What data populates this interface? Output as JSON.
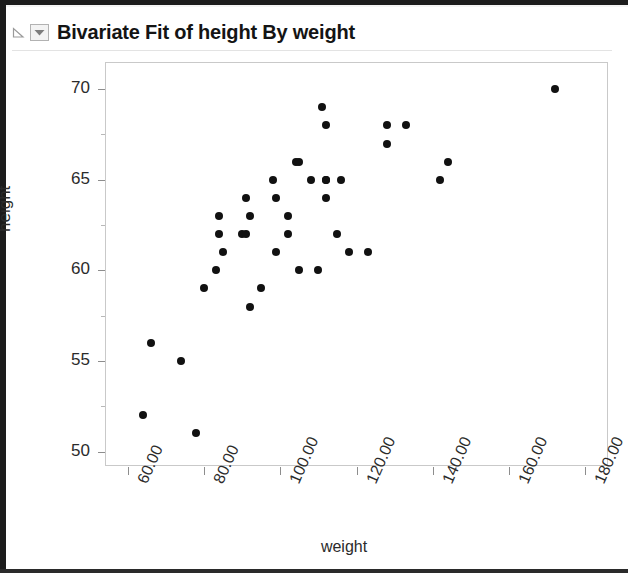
{
  "window": {
    "border_color": "#1c1c1c",
    "background": "#ffffff"
  },
  "header": {
    "title": "Bivariate Fit of height By weight",
    "disclosure_icon": "triangle-outline-icon",
    "menu_icon": "chevron-down-icon"
  },
  "chart_data": {
    "type": "scatter",
    "title": "Bivariate Fit of height By weight",
    "xlabel": "weight",
    "ylabel": "height",
    "xlim": [
      54,
      186
    ],
    "ylim": [
      49.2,
      71.5
    ],
    "xticks": [
      60,
      80,
      100,
      120,
      140,
      160,
      180
    ],
    "xtick_labels": [
      "60.00",
      "80.00",
      "100.00",
      "120.00",
      "140.00",
      "160.00",
      "180.00"
    ],
    "yticks": [
      50,
      55,
      60,
      65,
      70
    ],
    "ytick_labels": [
      "50",
      "55",
      "60",
      "65",
      "70"
    ],
    "y_minor_ticks": [
      52.5,
      57.5,
      62.5,
      67.5
    ],
    "grid": false,
    "legend": null,
    "marker": {
      "shape": "circle",
      "color": "#111111",
      "size": 8
    },
    "series": [
      {
        "name": "height by weight",
        "points": [
          {
            "x": 64,
            "y": 52
          },
          {
            "x": 66,
            "y": 56
          },
          {
            "x": 74,
            "y": 55
          },
          {
            "x": 78,
            "y": 51
          },
          {
            "x": 80,
            "y": 59
          },
          {
            "x": 83,
            "y": 60
          },
          {
            "x": 84,
            "y": 63
          },
          {
            "x": 84,
            "y": 62
          },
          {
            "x": 85,
            "y": 61
          },
          {
            "x": 90,
            "y": 62
          },
          {
            "x": 91,
            "y": 62
          },
          {
            "x": 91,
            "y": 64
          },
          {
            "x": 92,
            "y": 63
          },
          {
            "x": 92,
            "y": 58
          },
          {
            "x": 95,
            "y": 59
          },
          {
            "x": 98,
            "y": 65
          },
          {
            "x": 99,
            "y": 64
          },
          {
            "x": 99,
            "y": 61
          },
          {
            "x": 102,
            "y": 63
          },
          {
            "x": 102,
            "y": 62
          },
          {
            "x": 104,
            "y": 66
          },
          {
            "x": 105,
            "y": 66
          },
          {
            "x": 105,
            "y": 60
          },
          {
            "x": 108,
            "y": 65
          },
          {
            "x": 110,
            "y": 60
          },
          {
            "x": 111,
            "y": 69
          },
          {
            "x": 112,
            "y": 68
          },
          {
            "x": 112,
            "y": 65
          },
          {
            "x": 112,
            "y": 65
          },
          {
            "x": 112,
            "y": 64
          },
          {
            "x": 115,
            "y": 62
          },
          {
            "x": 116,
            "y": 65
          },
          {
            "x": 118,
            "y": 61
          },
          {
            "x": 123,
            "y": 61
          },
          {
            "x": 128,
            "y": 68
          },
          {
            "x": 128,
            "y": 67
          },
          {
            "x": 133,
            "y": 68
          },
          {
            "x": 142,
            "y": 65
          },
          {
            "x": 144,
            "y": 66
          },
          {
            "x": 172,
            "y": 70
          }
        ]
      }
    ]
  }
}
